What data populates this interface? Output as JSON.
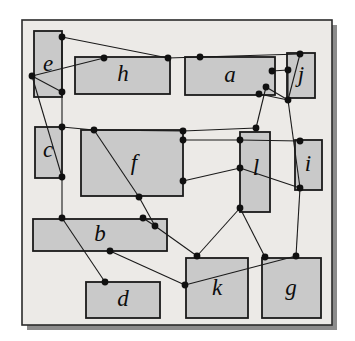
{
  "figure": {
    "type": "node-link-diagram",
    "canvas": {
      "width": 355,
      "height": 341
    },
    "colors": {
      "page_background": "#ffffff",
      "panel_background": "#eceae7",
      "panel_border": "#2b2b2b",
      "panel_shadow": "#8c8c8c",
      "rect_fill": "#c9c9c9",
      "rect_border": "#1a1a1a",
      "edge_stroke": "#1a1a1a",
      "node_fill": "#101010",
      "label_color": "#0d0d0d"
    },
    "panel": {
      "x": 22,
      "y": 20,
      "width": 310,
      "height": 305
    },
    "shadow": {
      "x": 27,
      "y": 25,
      "width": 310,
      "height": 305
    },
    "rectangles": [
      {
        "id": "e",
        "label": "e",
        "x": 34,
        "y": 31,
        "width": 28,
        "height": 66,
        "label_x": 48,
        "label_y": 66
      },
      {
        "id": "h",
        "label": "h",
        "x": 75,
        "y": 57,
        "width": 95,
        "height": 37,
        "label_x": 123,
        "label_y": 76
      },
      {
        "id": "a",
        "label": "a",
        "x": 185,
        "y": 57,
        "width": 90,
        "height": 38,
        "label_x": 230,
        "label_y": 77
      },
      {
        "id": "j",
        "label": "j",
        "x": 287,
        "y": 53,
        "width": 28,
        "height": 45,
        "label_x": 301,
        "label_y": 77
      },
      {
        "id": "c",
        "label": "c",
        "x": 35,
        "y": 127,
        "width": 27,
        "height": 51,
        "label_x": 48,
        "label_y": 152
      },
      {
        "id": "f",
        "label": "f",
        "x": 81,
        "y": 130,
        "width": 102,
        "height": 66,
        "label_x": 134,
        "label_y": 165
      },
      {
        "id": "l",
        "label": "l",
        "x": 240,
        "y": 132,
        "width": 30,
        "height": 80,
        "label_x": 256,
        "label_y": 170
      },
      {
        "id": "i",
        "label": "i",
        "x": 295,
        "y": 140,
        "width": 27,
        "height": 50,
        "label_x": 308,
        "label_y": 166
      },
      {
        "id": "b",
        "label": "b",
        "x": 33,
        "y": 219,
        "width": 134,
        "height": 32,
        "label_x": 100,
        "label_y": 236
      },
      {
        "id": "d",
        "label": "d",
        "x": 86,
        "y": 282,
        "width": 74,
        "height": 36,
        "label_x": 123,
        "label_y": 301
      },
      {
        "id": "k",
        "label": "k",
        "x": 186,
        "y": 258,
        "width": 62,
        "height": 60,
        "label_x": 217,
        "label_y": 290
      },
      {
        "id": "g",
        "label": "g",
        "x": 262,
        "y": 258,
        "width": 59,
        "height": 60,
        "label_x": 291,
        "label_y": 290
      }
    ],
    "nodes": [
      {
        "id": "n1",
        "x": 62,
        "y": 37
      },
      {
        "id": "n2",
        "x": 104,
        "y": 58
      },
      {
        "id": "n3",
        "x": 168,
        "y": 58
      },
      {
        "id": "n4",
        "x": 200,
        "y": 57
      },
      {
        "id": "n5",
        "x": 300,
        "y": 54
      },
      {
        "id": "n6",
        "x": 272,
        "y": 71
      },
      {
        "id": "n7",
        "x": 288,
        "y": 70
      },
      {
        "id": "n8",
        "x": 32,
        "y": 76
      },
      {
        "id": "n9",
        "x": 62,
        "y": 92
      },
      {
        "id": "n10",
        "x": 259,
        "y": 94
      },
      {
        "id": "n11",
        "x": 288,
        "y": 100
      },
      {
        "id": "n12",
        "x": 62,
        "y": 127
      },
      {
        "id": "n13",
        "x": 94,
        "y": 130
      },
      {
        "id": "n14",
        "x": 183,
        "y": 131
      },
      {
        "id": "n15",
        "x": 256,
        "y": 128
      },
      {
        "id": "n16",
        "x": 183,
        "y": 140
      },
      {
        "id": "n17",
        "x": 240,
        "y": 140
      },
      {
        "id": "n18",
        "x": 300,
        "y": 141
      },
      {
        "id": "n19",
        "x": 240,
        "y": 168
      },
      {
        "id": "n20",
        "x": 183,
        "y": 181
      },
      {
        "id": "n21",
        "x": 62,
        "y": 177
      },
      {
        "id": "n22",
        "x": 139,
        "y": 197
      },
      {
        "id": "n23",
        "x": 300,
        "y": 188
      },
      {
        "id": "n24",
        "x": 240,
        "y": 208
      },
      {
        "id": "n25",
        "x": 62,
        "y": 218
      },
      {
        "id": "n26",
        "x": 143,
        "y": 218
      },
      {
        "id": "n27",
        "x": 155,
        "y": 226
      },
      {
        "id": "n28",
        "x": 110,
        "y": 251
      },
      {
        "id": "n29",
        "x": 197,
        "y": 256
      },
      {
        "id": "n30",
        "x": 105,
        "y": 282
      },
      {
        "id": "n31",
        "x": 265,
        "y": 257
      },
      {
        "id": "n32",
        "x": 296,
        "y": 256
      },
      {
        "id": "n33",
        "x": 185,
        "y": 285
      },
      {
        "id": "n34",
        "x": 266,
        "y": 87
      }
    ],
    "edges": [
      {
        "from": "n1",
        "to": "n3"
      },
      {
        "from": "n3",
        "to": "n4"
      },
      {
        "from": "n4",
        "to": "n5"
      },
      {
        "from": "n1",
        "to": "n9"
      },
      {
        "from": "n2",
        "to": "n8"
      },
      {
        "from": "n8",
        "to": "n9"
      },
      {
        "from": "n8",
        "to": "n21"
      },
      {
        "from": "n9",
        "to": "n12"
      },
      {
        "from": "n5",
        "to": "n11"
      },
      {
        "from": "n6",
        "to": "n7"
      },
      {
        "from": "n7",
        "to": "n11"
      },
      {
        "from": "n10",
        "to": "n11"
      },
      {
        "from": "n11",
        "to": "n34"
      },
      {
        "from": "n11",
        "to": "n23"
      },
      {
        "from": "n34",
        "to": "n15"
      },
      {
        "from": "n12",
        "to": "n13"
      },
      {
        "from": "n13",
        "to": "n14"
      },
      {
        "from": "n14",
        "to": "n15"
      },
      {
        "from": "n16",
        "to": "n17"
      },
      {
        "from": "n17",
        "to": "n18"
      },
      {
        "from": "n13",
        "to": "n22"
      },
      {
        "from": "n22",
        "to": "n27"
      },
      {
        "from": "n20",
        "to": "n19"
      },
      {
        "from": "n19",
        "to": "n23"
      },
      {
        "from": "n21",
        "to": "n25"
      },
      {
        "from": "n25",
        "to": "n30"
      },
      {
        "from": "n26",
        "to": "n27"
      },
      {
        "from": "n27",
        "to": "n29"
      },
      {
        "from": "n28",
        "to": "n33"
      },
      {
        "from": "n29",
        "to": "n24"
      },
      {
        "from": "n24",
        "to": "n31"
      },
      {
        "from": "n23",
        "to": "n32"
      },
      {
        "from": "n32",
        "to": "n33"
      }
    ]
  }
}
